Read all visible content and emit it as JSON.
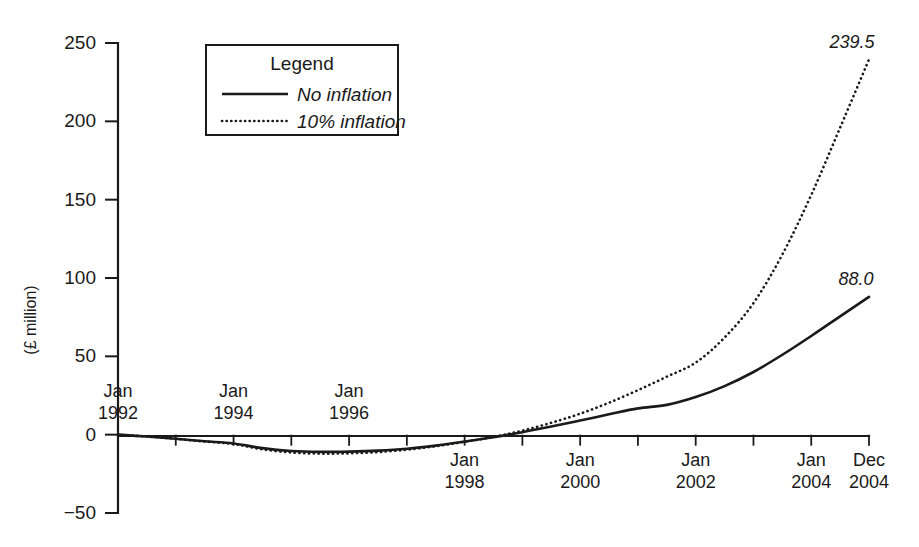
{
  "chart_data": {
    "type": "line",
    "title": "",
    "xlabel": "",
    "ylabel": "(£ million)",
    "ylim": [
      -50,
      250
    ],
    "grid": false,
    "legend_position": "upper-left-inside",
    "legend_title": "Legend",
    "y_ticks": [
      {
        "value": 250,
        "label": "250"
      },
      {
        "value": 200,
        "label": "200"
      },
      {
        "value": 150,
        "label": "150"
      },
      {
        "value": 100,
        "label": "100"
      },
      {
        "value": 50,
        "label": "50"
      },
      {
        "value": 0,
        "label": "0"
      },
      {
        "value": -50,
        "label": "−50"
      }
    ],
    "x_ticks": [
      {
        "index": 0,
        "line1": "Jan",
        "line2": "1992",
        "labeled": true,
        "below": false
      },
      {
        "index": 1,
        "line1": "",
        "line2": "",
        "labeled": false,
        "below": true
      },
      {
        "index": 2,
        "line1": "Jan",
        "line2": "1994",
        "labeled": true,
        "below": false
      },
      {
        "index": 3,
        "line1": "",
        "line2": "",
        "labeled": false,
        "below": true
      },
      {
        "index": 4,
        "line1": "Jan",
        "line2": "1996",
        "labeled": true,
        "below": false
      },
      {
        "index": 5,
        "line1": "",
        "line2": "",
        "labeled": false,
        "below": true
      },
      {
        "index": 6,
        "line1": "Jan",
        "line2": "1998",
        "labeled": true,
        "below": true
      },
      {
        "index": 7,
        "line1": "",
        "line2": "",
        "labeled": false,
        "below": true
      },
      {
        "index": 8,
        "line1": "Jan",
        "line2": "2000",
        "labeled": true,
        "below": true
      },
      {
        "index": 9,
        "line1": "",
        "line2": "",
        "labeled": false,
        "below": true
      },
      {
        "index": 10,
        "line1": "Jan",
        "line2": "2002",
        "labeled": true,
        "below": true
      },
      {
        "index": 11,
        "line1": "",
        "line2": "",
        "labeled": false,
        "below": true
      },
      {
        "index": 12,
        "line1": "Jan",
        "line2": "2004",
        "labeled": true,
        "below": true
      },
      {
        "index": 13,
        "line1": "Dec",
        "line2": "2004",
        "labeled": true,
        "below": true
      }
    ],
    "x": [
      1992.0,
      1992.5,
      1993.0,
      1993.5,
      1994.0,
      1994.5,
      1995.0,
      1995.5,
      1996.0,
      1996.5,
      1997.0,
      1997.5,
      1998.0,
      1998.5,
      1999.0,
      1999.5,
      2000.0,
      2000.5,
      2001.0,
      2001.5,
      2002.0,
      2002.5,
      2003.0,
      2003.5,
      2004.0,
      2004.5,
      2005.0
    ],
    "series": [
      {
        "name": "No inflation",
        "style": "solid",
        "end_label": "88.0",
        "values": [
          0.0,
          -1.2,
          -2.6,
          -4.2,
          -5.6,
          -8.6,
          -10.4,
          -11.0,
          -10.8,
          -10.2,
          -9.0,
          -7.0,
          -4.4,
          -1.6,
          1.6,
          5.2,
          9.0,
          13.0,
          16.8,
          19.0,
          24.0,
          31.0,
          40.0,
          51.0,
          63.0,
          75.5,
          88.0
        ]
      },
      {
        "name": "10% inflation",
        "style": "dotted",
        "end_label": "239.5",
        "values": [
          0.0,
          -1.2,
          -2.7,
          -4.4,
          -6.0,
          -9.4,
          -11.4,
          -12.1,
          -11.9,
          -11.1,
          -9.6,
          -7.4,
          -4.6,
          -1.4,
          2.6,
          7.6,
          13.4,
          20.4,
          28.4,
          37.0,
          46.0,
          62.0,
          84.0,
          115.0,
          153.0,
          196.0,
          239.5
        ]
      }
    ],
    "annotations": [
      {
        "text": "239.5",
        "series": "10% inflation",
        "at": "end"
      },
      {
        "text": "88.0",
        "series": "No inflation",
        "at": "end"
      }
    ]
  }
}
